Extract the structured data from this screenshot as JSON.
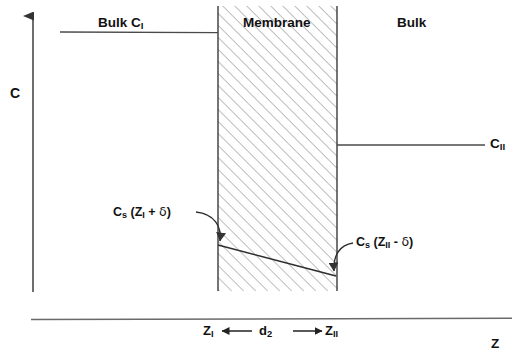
{
  "figure": {
    "type": "concentration-profile-diagram",
    "width": 521,
    "height": 359,
    "line_color": "#3a3a3a",
    "text_color": "#111111",
    "hatch_color": "#8a8a8a",
    "background": "#ffffff"
  },
  "axes": {
    "y_label": "C",
    "x_label": "Z",
    "y_axis": {
      "x": 33,
      "top": 6,
      "bottom": 292,
      "arrow": "up"
    },
    "x_axis": {
      "y": 319,
      "left": 31,
      "right": 512
    }
  },
  "regions": {
    "left_bulk_label": "Bulk C",
    "left_bulk_sub": "I",
    "membrane_label": "Membrane",
    "right_bulk_label": "Bulk",
    "membrane_box": {
      "left": 218,
      "right": 337,
      "top": 6,
      "bottom": 291
    }
  },
  "curves": {
    "bulk_I_level": {
      "y": 32,
      "x_start": 60,
      "x_end": 218
    },
    "bulk_II_level": {
      "y": 145,
      "x_start": 337,
      "x_end": 485
    },
    "membrane_gradient": {
      "x1": 218,
      "y1": 245,
      "x2": 336,
      "y2": 276
    }
  },
  "labels": {
    "c_ii": {
      "base": "C",
      "sub": "II"
    },
    "cs_left": {
      "base": "C",
      "sub": "s",
      "expr_open": " (Z",
      "expr_sub": "I",
      "expr_op": " + ",
      "delta": "δ",
      "expr_close": ")"
    },
    "cs_right": {
      "base": "C",
      "sub": "s",
      "expr_open": " (Z",
      "expr_sub": "II",
      "expr_op": " - ",
      "delta": "δ",
      "expr_close": ")"
    }
  },
  "dimension": {
    "left_marker": {
      "base": "Z",
      "sub": "I"
    },
    "thickness": {
      "base": "d",
      "sub": "2"
    },
    "right_marker": {
      "base": "Z",
      "sub": "II"
    },
    "arrow_y": 331,
    "arrow_left_x": 222,
    "arrow_right_x": 322
  }
}
